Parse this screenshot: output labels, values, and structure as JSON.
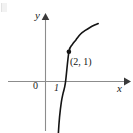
{
  "figure": {
    "kind": "math-graph",
    "background_color": "#ffffff"
  },
  "axes": {
    "x_axis_label": "x",
    "y_axis_label": "y",
    "origin_label": "0",
    "x_tick_label": "1",
    "axis_color": "#8c8c8c",
    "arrow_color": "#3a3a3a"
  },
  "annotations": {
    "point_label": "(2, 1)"
  },
  "chart_data": {
    "type": "line",
    "title": "",
    "xlabel": "x",
    "ylabel": "y",
    "grid": false,
    "legend": null,
    "curve_name": "logarithmic curve",
    "x_tick_values": [
      0,
      1
    ],
    "x_tick_labels": [
      "0",
      "1"
    ],
    "y_tick_values": [],
    "y_tick_labels": [],
    "xlim": [
      -1.6,
      4.6
    ],
    "ylim": [
      -2.9,
      2.4
    ],
    "x": [
      1.02,
      1.05,
      1.1,
      1.2,
      1.35,
      1.5,
      1.7,
      2.0,
      2.3,
      2.6,
      3.0,
      3.4,
      3.8,
      4.2,
      4.5
    ],
    "y": [
      -2.85,
      -2.3,
      -1.75,
      -1.2,
      -0.7,
      -0.4,
      -0.05,
      1.0,
      1.25,
      1.4,
      1.6,
      1.72,
      1.82,
      1.9,
      1.95
    ],
    "annotated_points": [
      {
        "label": "(2, 1)",
        "x": 2,
        "y": 1
      }
    ],
    "curve_color": "#141414"
  }
}
